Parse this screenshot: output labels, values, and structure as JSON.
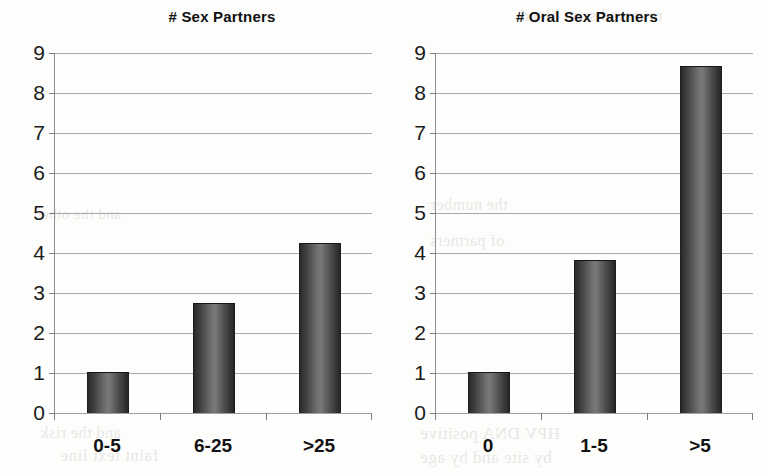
{
  "page": {
    "background_color": "#fdfdfb",
    "bleed_through_text": [
      "reversed scan bleed",
      "and the other",
      "the number",
      "of partners",
      "faint text line",
      "HPV DNA positive",
      "by site and by age",
      "and the risk"
    ]
  },
  "chart_data": [
    {
      "type": "bar",
      "title": "#  Sex Partners",
      "categories": [
        "0-5",
        "6-25",
        ">25"
      ],
      "values": [
        1.0,
        2.72,
        4.22
      ],
      "xlabel": "",
      "ylabel": "",
      "ylim": [
        0,
        9
      ],
      "yticks": [
        0,
        1,
        2,
        3,
        4,
        5,
        6,
        7,
        8,
        9
      ],
      "ytick_labels": [
        "0",
        "1",
        "2",
        "3",
        "4",
        "5",
        "6",
        "7",
        "8",
        "9"
      ],
      "grid": true,
      "legend": false,
      "bar_color": "#4a4a4a"
    },
    {
      "type": "bar",
      "title": "# Oral Sex Partners",
      "categories": [
        "0",
        "1-5",
        ">5"
      ],
      "values": [
        1.0,
        3.8,
        8.65
      ],
      "xlabel": "",
      "ylabel": "",
      "ylim": [
        0,
        9
      ],
      "yticks": [
        0,
        1,
        2,
        3,
        4,
        5,
        6,
        7,
        8,
        9
      ],
      "ytick_labels": [
        "0",
        "1",
        "2",
        "3",
        "4",
        "5",
        "6",
        "7",
        "8",
        "9"
      ],
      "grid": true,
      "legend": false,
      "bar_color": "#4a4a4a"
    }
  ]
}
